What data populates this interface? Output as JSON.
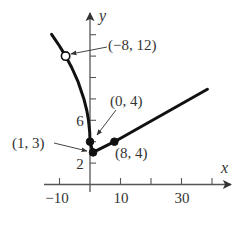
{
  "figure": {
    "x_axis_label": "x",
    "y_axis_label": "y",
    "x_tick_labels": [
      "−10",
      "10",
      "30"
    ],
    "y_tick_labels": [
      "6",
      "2"
    ],
    "point_labels": {
      "p_neg8_12": "(−8, 12)",
      "p_0_4": "(0, 4)",
      "p_1_3": "(1, 3)",
      "p_8_4": "(8, 4)"
    }
  },
  "colors": {
    "curve": "#111111",
    "axis": "#555555",
    "text": "#333333",
    "background": "#ffffff"
  },
  "chart_data": {
    "type": "line",
    "title": "",
    "xlabel": "x",
    "ylabel": "y",
    "xlim": [
      -15,
      46
    ],
    "ylim": [
      -1,
      16
    ],
    "grid": false,
    "legend": null,
    "x_ticks": [
      -10,
      10,
      20,
      30,
      40
    ],
    "x_tick_labels_shown": {
      "-10": "−10",
      "10": "10",
      "30": "30"
    },
    "y_ticks": [
      2,
      4,
      6,
      8,
      10,
      12,
      14
    ],
    "y_tick_labels_shown": {
      "2": "2",
      "6": "6"
    },
    "series": [
      {
        "name": "left branch",
        "x": [
          -12.6,
          -10,
          -8,
          -6,
          -4,
          -2,
          -1,
          -0.5,
          -0.1,
          0
        ],
        "y": [
          14.04,
          12.94,
          12,
          10.93,
          9.66,
          8,
          6.83,
          6,
          4.89,
          4
        ]
      },
      {
        "name": "right branch",
        "x": [
          0,
          1,
          8,
          38.5
        ],
        "y": [
          4,
          3,
          4,
          8.9
        ]
      }
    ],
    "points": [
      {
        "x": -8,
        "y": 12,
        "label": "(−8, 12)",
        "marker": "open"
      },
      {
        "x": 0,
        "y": 4,
        "label": "(0, 4)",
        "marker": "filled"
      },
      {
        "x": 1,
        "y": 3,
        "label": "(1, 3)",
        "marker": "filled"
      },
      {
        "x": 8,
        "y": 4,
        "label": "(8, 4)",
        "marker": "filled"
      }
    ]
  }
}
